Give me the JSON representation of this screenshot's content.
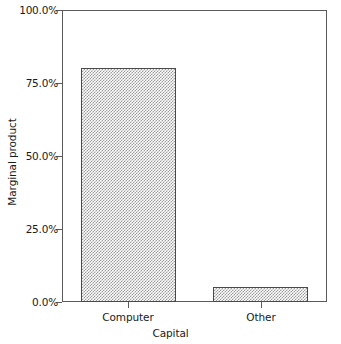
{
  "chart_data": {
    "type": "bar",
    "title": "",
    "xlabel": "Capital",
    "ylabel": "Marginal product",
    "categories": [
      "Computer",
      "Other"
    ],
    "values": [
      80.0,
      5.0
    ],
    "value_labels": [
      "80.0%",
      "5.0%"
    ],
    "ylim": [
      0,
      100
    ],
    "yticks": [
      0,
      25,
      50,
      75,
      100
    ],
    "ytick_labels": [
      "0.0%",
      "25.0%",
      "50.0%",
      "75.0%",
      "100.0%"
    ],
    "grid": false,
    "legend": false,
    "legend_position": "none",
    "bar_fill": "#9a9a9a",
    "bar_fill_style": "checkerboard-hatch",
    "bar_outline": "#4a4a4a",
    "axis_color": "#5a5a5a",
    "background": "#ffffff",
    "text_color": "#1a1a1a"
  },
  "axes": {
    "y_title": "Marginal product",
    "x_title": "Capital",
    "y_ticks": [
      {
        "label": "100.0%",
        "value": 100
      },
      {
        "label": "75.0%",
        "value": 75
      },
      {
        "label": "50.0%",
        "value": 50
      },
      {
        "label": "25.0%",
        "value": 25
      },
      {
        "label": "0.0%",
        "value": 0
      }
    ],
    "x_ticks": [
      {
        "label": "Computer"
      },
      {
        "label": "Other"
      }
    ]
  }
}
